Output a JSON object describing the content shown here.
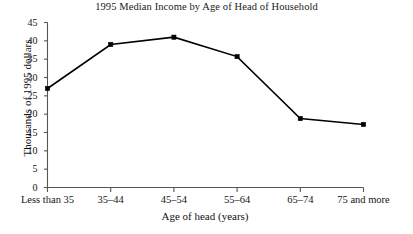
{
  "chart_data": {
    "type": "line",
    "title": "1995 Median Income by Age of Head of Household",
    "xlabel": "Age of head (years)",
    "ylabel": "Thousands of 1995 dollars",
    "categories": [
      "Less than 35",
      "35–44",
      "45–54",
      "55–64",
      "65–74",
      "75 and more"
    ],
    "values": [
      27,
      39,
      41,
      35.7,
      18.8,
      17.2
    ],
    "yticks": [
      0,
      5,
      10,
      15,
      20,
      25,
      30,
      35,
      40,
      45
    ],
    "ytick_labels": [
      "0",
      "5",
      "10",
      "15",
      "20",
      "25",
      "30",
      "35",
      "40",
      "45"
    ],
    "ylim": [
      0,
      45
    ],
    "grid": false,
    "legend": "none",
    "marker": "square",
    "line_color": "#000000",
    "marker_color": "#000000",
    "axis_color": "#555555"
  }
}
